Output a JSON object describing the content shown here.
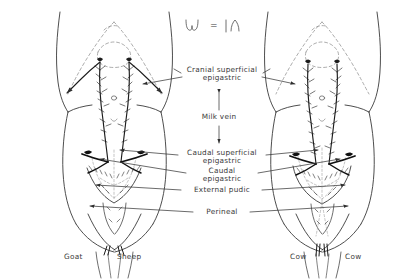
{
  "figure": {
    "line_color": "#2e2e2e",
    "dashed_color": "#8a8a8a",
    "text_color": "#3a3a3a",
    "background": "#ffffff"
  },
  "legend": {
    "equals_sign": "=",
    "left_symbol_name": "udder-outline-symbol",
    "right_symbol_name": "half-udder-outline-symbol"
  },
  "labels": [
    {
      "id": "cranial-superficial-epigastric",
      "line1": "Cranial superficial",
      "line2": "epigastric"
    },
    {
      "id": "milk-vein",
      "line1": "Milk vein",
      "line2": ""
    },
    {
      "id": "caudal-superficial-epigastric",
      "line1": "Caudal superficial",
      "line2": "epigastric"
    },
    {
      "id": "caudal-epigastric",
      "line1": "Caudal",
      "line2": "epigastric"
    },
    {
      "id": "external-pudic",
      "line1": "External pudic",
      "line2": ""
    },
    {
      "id": "perineal",
      "line1": "Perineal",
      "line2": ""
    }
  ],
  "species": [
    {
      "id": "goat",
      "name": "Goat"
    },
    {
      "id": "sheep",
      "name": "Sheep"
    },
    {
      "id": "cow-left",
      "name": "Cow"
    },
    {
      "id": "cow-right",
      "name": "Cow"
    }
  ]
}
